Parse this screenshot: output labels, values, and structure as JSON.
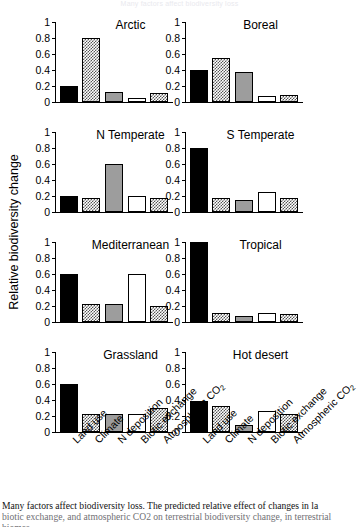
{
  "figure": {
    "top_title": "Many factors affect biodiversity loss",
    "y_axis_label": "Relative biodiversity change",
    "caption_line1": "Many factors affect biodiversity loss. The predicted relative effect of changes in la",
    "caption_line2": "biotic exchange, and atmospheric CO2 on terrestrial biodiversity change, in terrestrial biomes"
  },
  "chart_data": {
    "type": "bar",
    "title": "Many factors affect biodiversity loss",
    "xlabel": "",
    "ylabel": "Relative biodiversity change",
    "ylim": [
      0,
      1
    ],
    "yticks": [
      "0",
      "0.2",
      "0.4",
      "0.6",
      "0.8",
      "1"
    ],
    "ytick_values": [
      0,
      0.2,
      0.4,
      0.6,
      0.8,
      1
    ],
    "grid": false,
    "legend_position": "none",
    "categories": [
      "Land use",
      "Climate",
      "N deposition",
      "Biotic exchange",
      "Atmospheric CO2"
    ],
    "category_labels_html": [
      "Land use",
      "Climate",
      "N deposition",
      "Biotic exchange",
      "Atmospheric CO<sub>2</sub>"
    ],
    "bar_fills": [
      "solid-black",
      "checkered",
      "solid-gray",
      "white",
      "checkered"
    ],
    "panels": [
      {
        "name": "Arctic",
        "values": [
          0.2,
          0.8,
          0.12,
          0.05,
          0.11
        ]
      },
      {
        "name": "Boreal",
        "values": [
          0.4,
          0.55,
          0.38,
          0.08,
          0.09
        ]
      },
      {
        "name": "N Temperate",
        "values": [
          0.2,
          0.17,
          0.6,
          0.2,
          0.17
        ]
      },
      {
        "name": "S Temperate",
        "values": [
          0.8,
          0.17,
          0.15,
          0.25,
          0.17
        ]
      },
      {
        "name": "Mediterranean",
        "values": [
          0.6,
          0.23,
          0.23,
          0.6,
          0.2
        ]
      },
      {
        "name": "Tropical",
        "values": [
          1.0,
          0.11,
          0.08,
          0.11,
          0.1
        ]
      },
      {
        "name": "Grassland",
        "values": [
          0.6,
          0.22,
          0.22,
          0.22,
          0.3
        ]
      },
      {
        "name": "Hot desert",
        "values": [
          0.39,
          0.32,
          0.09,
          0.26,
          0.22
        ]
      }
    ]
  }
}
